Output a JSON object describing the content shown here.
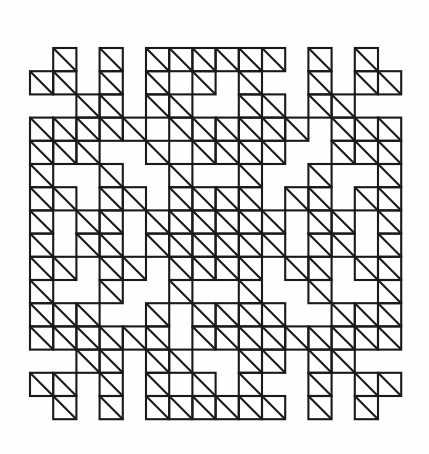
{
  "artwork": {
    "title": "Symmetric geometric lattice pattern",
    "description": "Cross-stitch style ornamental motif built from unit squares, each containing a diagonal running from its top-left corner to its bottom-right corner.",
    "background_color": "#ffffff",
    "stroke_color": "#1a1a1a",
    "stroke_width": 2.1,
    "canvas": {
      "width": 429,
      "height": 454
    }
  },
  "grid": {
    "columns": 16,
    "rows": 16,
    "cell_size": 23.2,
    "origin_x": 30,
    "origin_y": 48,
    "diagonal_direction": "top-left-to-bottom-right",
    "symmetry": "four-fold (horizontal and vertical mirror)",
    "filled_cell_count": 174,
    "matrix": [
      [
        0,
        1,
        0,
        1,
        0,
        1,
        1,
        1,
        1,
        1,
        1,
        0,
        1,
        0,
        1,
        0
      ],
      [
        1,
        1,
        0,
        1,
        0,
        1,
        0,
        1,
        0,
        1,
        0,
        0,
        1,
        0,
        1,
        1
      ],
      [
        0,
        0,
        1,
        1,
        0,
        1,
        1,
        0,
        0,
        1,
        1,
        0,
        1,
        1,
        0,
        0
      ],
      [
        1,
        1,
        1,
        1,
        1,
        0,
        1,
        1,
        1,
        1,
        1,
        1,
        0,
        1,
        1,
        1
      ],
      [
        1,
        1,
        1,
        0,
        0,
        1,
        0,
        1,
        1,
        1,
        1,
        0,
        0,
        1,
        1,
        1
      ],
      [
        1,
        0,
        0,
        1,
        0,
        0,
        1,
        0,
        0,
        1,
        0,
        0,
        1,
        0,
        0,
        1
      ],
      [
        1,
        1,
        0,
        1,
        1,
        0,
        1,
        1,
        1,
        1,
        0,
        1,
        1,
        0,
        1,
        1
      ],
      [
        1,
        0,
        1,
        1,
        0,
        1,
        1,
        1,
        1,
        1,
        1,
        0,
        1,
        1,
        0,
        1
      ],
      [
        1,
        0,
        1,
        1,
        0,
        1,
        1,
        1,
        1,
        1,
        1,
        0,
        1,
        1,
        0,
        1
      ],
      [
        1,
        1,
        0,
        1,
        1,
        0,
        1,
        1,
        1,
        1,
        0,
        1,
        1,
        0,
        1,
        1
      ],
      [
        1,
        0,
        0,
        1,
        0,
        0,
        1,
        0,
        0,
        1,
        0,
        0,
        1,
        0,
        0,
        1
      ],
      [
        1,
        1,
        1,
        0,
        0,
        1,
        0,
        1,
        1,
        1,
        1,
        0,
        0,
        1,
        1,
        1
      ],
      [
        1,
        1,
        1,
        1,
        1,
        1,
        0,
        1,
        1,
        1,
        1,
        1,
        1,
        1,
        1,
        1
      ],
      [
        0,
        0,
        1,
        1,
        0,
        1,
        1,
        0,
        0,
        1,
        1,
        0,
        1,
        1,
        0,
        0
      ],
      [
        1,
        1,
        0,
        1,
        0,
        1,
        0,
        1,
        0,
        1,
        0,
        0,
        1,
        0,
        1,
        1
      ],
      [
        0,
        1,
        0,
        1,
        0,
        1,
        1,
        1,
        1,
        1,
        1,
        0,
        1,
        0,
        1,
        0
      ]
    ]
  }
}
